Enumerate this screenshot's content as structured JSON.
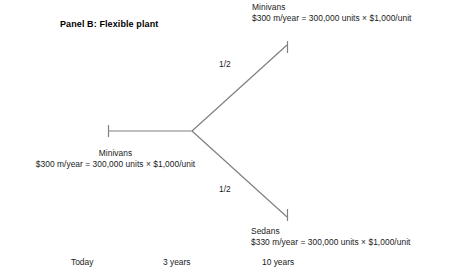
{
  "panel": {
    "title": "Panel B: Flexible plant"
  },
  "tree": {
    "branch_node": {
      "x": 192,
      "y": 131
    },
    "stroke_color": "#808080",
    "nodes": [
      {
        "id": "left-terminal",
        "name": "Minivans",
        "line1": "Minivans",
        "line2": "$300 m/year = 300,000 units × $1,000/unit",
        "endpoint": {
          "x": 108,
          "y": 131
        }
      },
      {
        "id": "top-terminal",
        "name": "Minivans",
        "line1": "Minivans",
        "line2": "$300 m/year = 300,000 units × $1,000/unit",
        "endpoint": {
          "x": 287,
          "y": 44
        }
      },
      {
        "id": "bottom-terminal",
        "name": "Sedans",
        "line1": "Sedans",
        "line2": "$330 m/year = 300,000 units × $1,000/unit",
        "endpoint": {
          "x": 287,
          "y": 218
        }
      }
    ],
    "probabilities": {
      "top": "1/2",
      "bottom": "1/2"
    }
  },
  "timeline": {
    "today": "Today",
    "three_years": "3 years",
    "ten_years": "10 years"
  }
}
